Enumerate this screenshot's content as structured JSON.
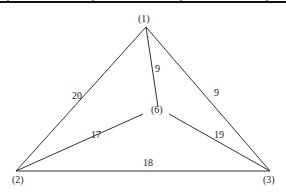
{
  "diagram": {
    "type": "weighted-graph",
    "nodes": [
      {
        "id": "1",
        "label": "(1)"
      },
      {
        "id": "2",
        "label": "(2)"
      },
      {
        "id": "3",
        "label": "(3)"
      },
      {
        "id": "6",
        "label": "(6)"
      }
    ],
    "edges": [
      {
        "from": "1",
        "to": "2",
        "weight": "20"
      },
      {
        "from": "1",
        "to": "3",
        "weight": "9"
      },
      {
        "from": "1",
        "to": "6",
        "weight": "9"
      },
      {
        "from": "2",
        "to": "6",
        "weight": "17"
      },
      {
        "from": "6",
        "to": "3",
        "weight": "19"
      },
      {
        "from": "2",
        "to": "3",
        "weight": "18"
      }
    ],
    "colors": {
      "line": "#333333",
      "text": "#222222",
      "background": "#ffffff"
    }
  }
}
